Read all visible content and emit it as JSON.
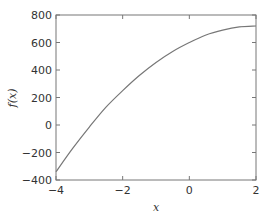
{
  "chart_data": {
    "type": "line",
    "title": "",
    "xlabel": "x",
    "ylabel": "f(x)",
    "xlim": [
      -4,
      2
    ],
    "ylim": [
      -400,
      800
    ],
    "xticks": [
      -4,
      -2,
      0,
      2
    ],
    "yticks": [
      -400,
      -200,
      0,
      200,
      400,
      600,
      800
    ],
    "xtick_labels": [
      "−4",
      "−2",
      "0",
      "2"
    ],
    "ytick_labels": [
      "−400",
      "−200",
      "0",
      "200",
      "400",
      "600",
      "800"
    ],
    "grid": false,
    "legend": null,
    "series": [
      {
        "name": "f(x)",
        "color": "#777777",
        "x": [
          -4,
          -3.5,
          -3,
          -2.5,
          -2,
          -1.5,
          -1,
          -0.5,
          0,
          0.5,
          1,
          1.5,
          2
        ],
        "y": [
          -340,
          -170,
          -15,
          130,
          250,
          360,
          455,
          535,
          600,
          655,
          690,
          713,
          720
        ]
      }
    ]
  },
  "colors": {
    "axes": "#777777",
    "line": "#777777",
    "text": "#333333"
  }
}
